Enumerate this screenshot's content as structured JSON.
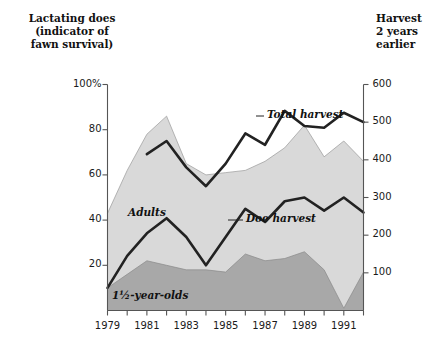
{
  "chart_data": {
    "type": "area",
    "title": "",
    "x": [
      1979,
      1980,
      1981,
      1982,
      1983,
      1984,
      1985,
      1986,
      1987,
      1988,
      1989,
      1990,
      1991,
      1992
    ],
    "xlabel": "",
    "xlim": [
      1979,
      1992
    ],
    "x_tick_labels": [
      "1979",
      "1981",
      "1983",
      "1985",
      "1987",
      "1989",
      "1991"
    ],
    "x_ticks": [
      1979,
      1981,
      1983,
      1985,
      1987,
      1989,
      1991
    ],
    "x_minor_ticks": [
      1980,
      1982,
      1984,
      1986,
      1988,
      1990,
      1992
    ],
    "grid": false,
    "legend_position": "inline-annotations",
    "left_axis": {
      "label": "Lactating does\n(indicator of\nfawn survival)",
      "ticks": [
        20,
        40,
        60,
        80,
        100
      ],
      "tick_labels": [
        "20",
        "40",
        "60",
        "80",
        "100%"
      ],
      "lim": [
        0,
        100
      ],
      "unit": "%"
    },
    "right_axis": {
      "label": "Harvest\n2 years\nearlier",
      "ticks": [
        100,
        200,
        300,
        400,
        500,
        600
      ],
      "tick_labels": [
        "100",
        "200",
        "300",
        "400",
        "500",
        "600"
      ],
      "lim": [
        0,
        600
      ],
      "unit": ""
    },
    "series": [
      {
        "name": "Adults",
        "kind": "area",
        "axis": "left",
        "color": "#d9d9d9",
        "stacked_top": true,
        "values": [
          43,
          62,
          78,
          86,
          65,
          60,
          61,
          62,
          66,
          72,
          82,
          68,
          75,
          66
        ]
      },
      {
        "name": "1½-year-olds",
        "kind": "area",
        "axis": "left",
        "color": "#a8a8a8",
        "values": [
          10,
          16,
          22,
          20,
          18,
          18,
          17,
          25,
          22,
          23,
          26,
          18,
          1,
          17
        ]
      },
      {
        "name": "Total harvest",
        "kind": "line",
        "axis": "right",
        "color": "#222222",
        "starts_at": 1981,
        "values": [
          null,
          null,
          415,
          450,
          380,
          330,
          390,
          470,
          440,
          530,
          490,
          485,
          525,
          500
        ]
      },
      {
        "name": "Doe harvest",
        "kind": "line",
        "axis": "right",
        "color": "#222222",
        "values": [
          60,
          145,
          205,
          245,
          195,
          120,
          195,
          270,
          235,
          290,
          300,
          265,
          300,
          260
        ]
      }
    ],
    "annotations": [
      {
        "text": "Total harvest",
        "series": "Total harvest",
        "leader": true
      },
      {
        "text": "Doe harvest",
        "series": "Doe harvest",
        "leader": true
      },
      {
        "text": "Adults",
        "series": "Adults",
        "leader": false
      },
      {
        "text": "1½-year-olds",
        "series": "1½-year-olds",
        "leader": false
      }
    ]
  },
  "labels": {
    "left_axis_title": "Lactating does\n(indicator of\nfawn survival)",
    "right_axis_title": "Harvest\n2 years\nearlier",
    "adults": "Adults",
    "yearlings": "1½-year-olds",
    "total_harvest": "Total harvest",
    "doe_harvest": "Doe harvest"
  },
  "left_ticks": [
    {
      "label": "100%",
      "value": 100
    },
    {
      "label": "80",
      "value": 80
    },
    {
      "label": "60",
      "value": 60
    },
    {
      "label": "40",
      "value": 40
    },
    {
      "label": "20",
      "value": 20
    }
  ],
  "right_ticks": [
    {
      "label": "600",
      "value": 600
    },
    {
      "label": "500",
      "value": 500
    },
    {
      "label": "400",
      "value": 400
    },
    {
      "label": "300",
      "value": 300
    },
    {
      "label": "200",
      "value": 200
    },
    {
      "label": "100",
      "value": 100
    }
  ],
  "x_ticks": [
    {
      "label": "1979",
      "value": 1979
    },
    {
      "label": "1981",
      "value": 1981
    },
    {
      "label": "1983",
      "value": 1983
    },
    {
      "label": "1985",
      "value": 1985
    },
    {
      "label": "1987",
      "value": 1987
    },
    {
      "label": "1989",
      "value": 1989
    },
    {
      "label": "1991",
      "value": 1991
    }
  ],
  "colors": {
    "adults_area": "#d9d9d9",
    "yearlings_area": "#a8a8a8",
    "line": "#222222",
    "axis": "#555555",
    "text": "#1a1a1a",
    "background": "#ffffff"
  }
}
